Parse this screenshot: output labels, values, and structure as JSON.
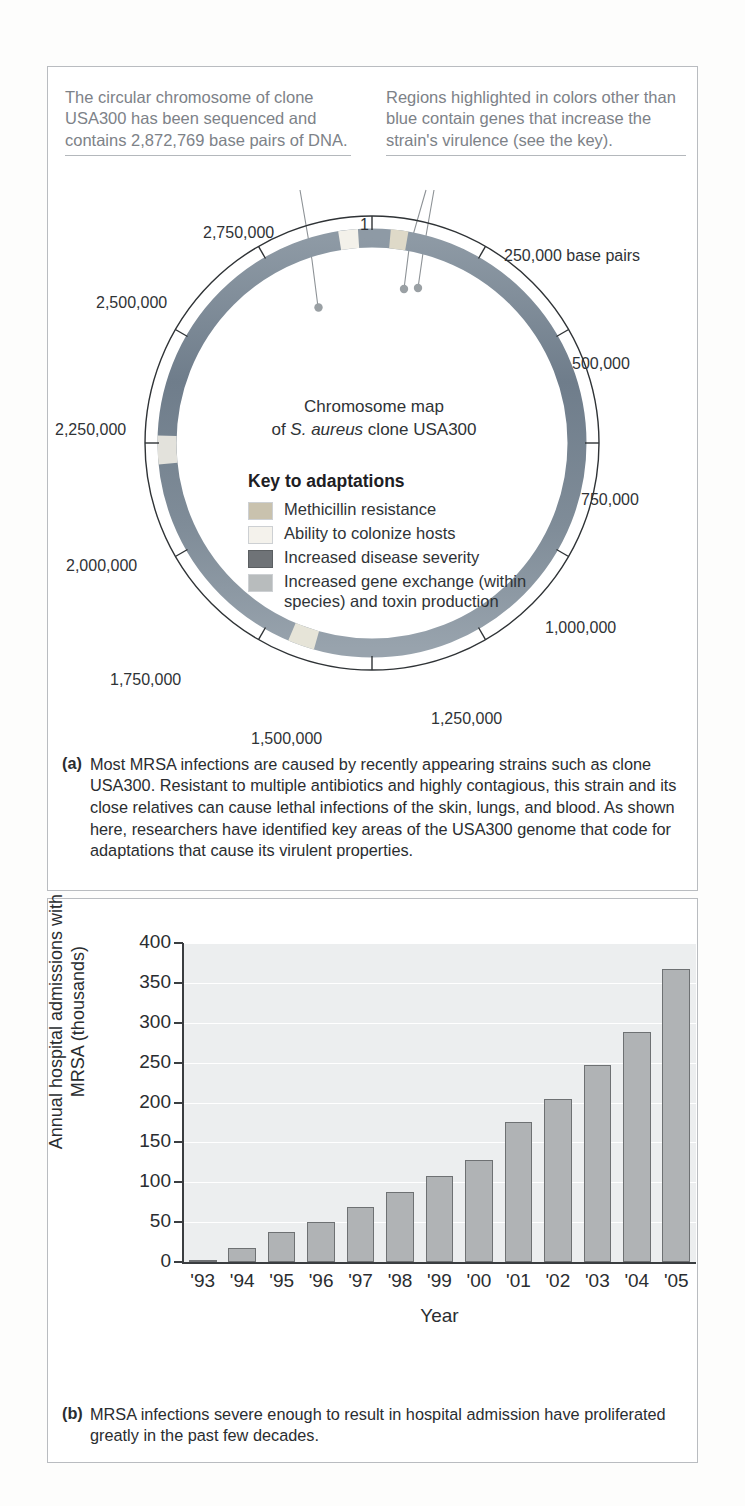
{
  "figure": {
    "panel_a": {
      "callout_left": "The circular chromosome of clone USA300 has been sequenced and contains 2,872,769 base pairs of DNA.",
      "callout_right": "Regions highlighted in colors other than blue contain genes that increase the strain's virulence (see the key).",
      "map_title_line1": "Chromosome map",
      "map_title_line2_pre": "of ",
      "map_title_species": "S. aureus",
      "map_title_line2_post": " clone USA300",
      "key_title": "Key to adaptations",
      "key_items": [
        {
          "label": "Methicillin resistance",
          "color": "#c9c2ae"
        },
        {
          "label": "Ability to colonize hosts",
          "color": "#f4f2ec"
        },
        {
          "label": "Increased disease severity",
          "color": "#6f7377"
        },
        {
          "label": "Increased gene exchange (within species) and toxin production",
          "color": "#b8bcbd"
        }
      ],
      "ring_color": "#7b8894",
      "tick_labels": [
        "1",
        "250,000 base pairs",
        "500,000",
        "750,000",
        "1,000,000",
        "1,250,000",
        "1,500,000",
        "1,750,000",
        "2,000,000",
        "2,250,000",
        "2,500,000",
        "2,750,000"
      ],
      "caption_marker": "(a)",
      "caption_text": "Most MRSA infections are caused by recently appearing strains such as clone USA300. Resistant to multiple antibiotics and highly contagious, this strain and its close relatives can cause lethal infections of the skin, lungs, and blood. As shown here, researchers have identified key areas of the USA300 genome that code for adaptations that cause its virulent properties."
    },
    "panel_b": {
      "caption_marker": "(b)",
      "caption_text": "MRSA infections severe enough to result in hospital admission have proliferated greatly in the past few decades."
    }
  },
  "chart_data": {
    "type": "bar",
    "title": "",
    "categories": [
      "'93",
      "'94",
      "'95",
      "'96",
      "'97",
      "'98",
      "'99",
      "'00",
      "'01",
      "'02",
      "'03",
      "'04",
      "'05"
    ],
    "values": [
      2,
      17,
      38,
      50,
      69,
      88,
      108,
      128,
      175,
      205,
      247,
      288,
      368
    ],
    "xlabel": "Year",
    "ylabel": "Annual hospital admissions with MRSA (thousands)",
    "ylim": [
      0,
      400
    ],
    "yticks": [
      0,
      50,
      100,
      150,
      200,
      250,
      300,
      350,
      400
    ],
    "ytick_labels": [
      "0",
      "50",
      "100",
      "150",
      "200",
      "250",
      "300",
      "350",
      "400"
    ],
    "grid": true,
    "legend": "none",
    "bar_color": "#b0b3b5",
    "plot_background": "#eceeef"
  }
}
